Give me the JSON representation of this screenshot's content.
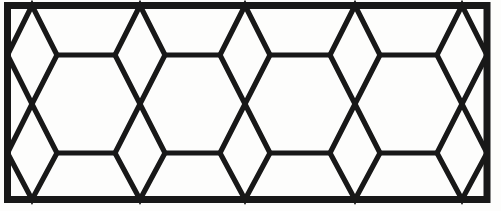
{
  "figure": {
    "type": "line-drawing",
    "width": 501,
    "height": 211,
    "background_color": "#fdfdfc",
    "stroke_color": "#181818",
    "border_stroke_width": 7,
    "lattice_stroke_width": 5.2
  },
  "geometry": {
    "frame": {
      "left": 7.5,
      "top": 5.5,
      "right": 487.0,
      "bottom": 199.5,
      "label": "outer rectangular frame"
    },
    "rows": {
      "top_y": 5.5,
      "upper_waist_y": 55.0,
      "middle_y": 104.0,
      "lower_waist_y": 153.0,
      "bottom_y": 199.5
    },
    "columns": [
      32,
      140,
      245,
      355,
      462
    ],
    "column_labels": [
      "chain-1",
      "chain-2",
      "chain-3",
      "chain-4",
      "chain-5"
    ],
    "half_width": 25,
    "description": "Five vertical zigzag chains of stacked diamonds span the panel. Each chain meets the frame at top and bottom apexes, pinches inward at the upper and lower waist lines, and crosses itself at the middle line. Horizontal bars at the upper and lower waist lines join adjacent chains, forming elongated hexagon cells between them."
  },
  "cells": {
    "hexagon_count": 8,
    "diamond_count": 20,
    "notes": "Upper band and lower band each contain four large hexagons; the chains contribute the narrow diamond columns."
  },
  "legend": {
    "caption": ""
  }
}
